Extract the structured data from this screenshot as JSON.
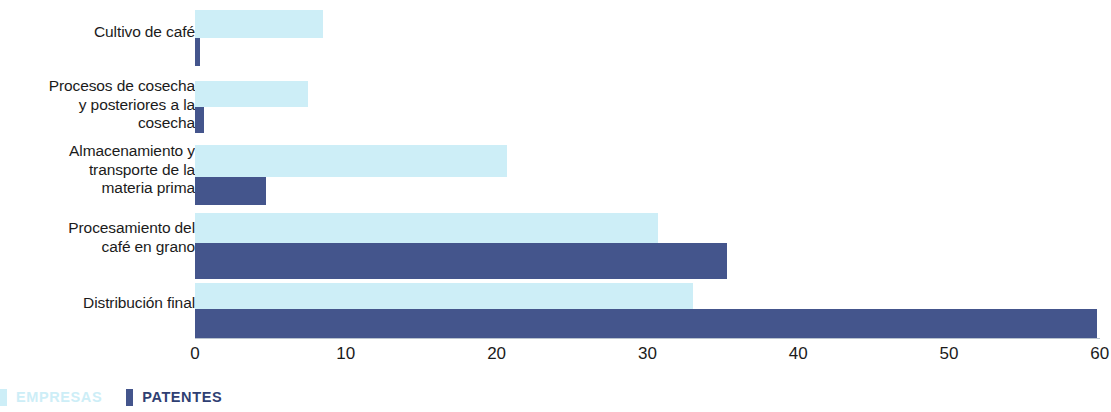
{
  "chart_data": {
    "type": "bar",
    "orientation": "horizontal",
    "title": "",
    "subtitle": "",
    "xlabel": "",
    "ylabel": "",
    "xlim": [
      0,
      60
    ],
    "xticks": [
      "0",
      "10",
      "20",
      "30",
      "40",
      "50",
      "60"
    ],
    "xtick_values": [
      0,
      10,
      20,
      30,
      40,
      50,
      60
    ],
    "grid": false,
    "legend_position": "bottom-left",
    "categories": [
      "Cultivo de café",
      "Procesos de cosecha\ny posteriores a la\ncosecha",
      "Almacenamiento y\ntransporte de la\nmateria prima",
      "Procesamiento del\ncafé en grano",
      "Distribución final"
    ],
    "series": [
      {
        "name": "EMPRESAS",
        "color": "#cdeef7",
        "values": [
          8.5,
          7.5,
          20.7,
          30.7,
          33.0
        ]
      },
      {
        "name": "PATENTES",
        "color": "#44558c",
        "values": [
          0.3,
          0.6,
          4.7,
          35.3,
          59.8
        ]
      }
    ]
  },
  "legend": {
    "items": [
      {
        "label": "EMPRESAS",
        "color": "#cdeef7"
      },
      {
        "label": "PATENTES",
        "color": "#44558c"
      }
    ]
  },
  "axis": {
    "ticks": [
      "0",
      "10",
      "20",
      "30",
      "40",
      "50",
      "60"
    ]
  }
}
